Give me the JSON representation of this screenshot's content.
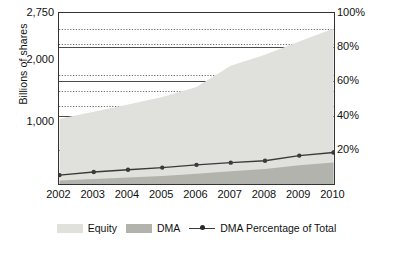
{
  "chart_data": {
    "type": "area",
    "title": "",
    "subtitle": "",
    "ylabel": "Billions of shares",
    "xlabel": "",
    "categories": [
      "2002",
      "2003",
      "2004",
      "2005",
      "2006",
      "2007",
      "2008",
      "2009",
      "2010"
    ],
    "x": [
      2002,
      2003,
      2004,
      2005,
      2006,
      2007,
      2008,
      2009,
      2010
    ],
    "yaxis_left": {
      "label": "Billions of shares",
      "ticks": [
        {
          "value": 1000,
          "text": "1,000"
        },
        {
          "value": 2000,
          "text": "2,000"
        },
        {
          "value": 2750,
          "text": "2,750"
        }
      ],
      "ylim": [
        0,
        2750
      ],
      "minor_gridlines": true,
      "minor_gridline_values": [
        1250,
        1500,
        1750,
        2250,
        2500
      ]
    },
    "yaxis_right": {
      "label": "",
      "ticks": [
        {
          "value": 20,
          "text": "20%"
        },
        {
          "value": 40,
          "text": "40%"
        },
        {
          "value": 60,
          "text": "60%"
        },
        {
          "value": 80,
          "text": "80%"
        },
        {
          "value": 100,
          "text": "100%"
        }
      ],
      "ylim": [
        0,
        100
      ]
    },
    "grid": true,
    "legend_position": "bottom",
    "series": [
      {
        "name": "Equity",
        "type": "area",
        "axis": "left",
        "color": "#e0e0dc",
        "values": [
          1050,
          1160,
          1280,
          1400,
          1560,
          1900,
          2080,
          2290,
          2500
        ]
      },
      {
        "name": "DMA",
        "type": "area",
        "axis": "left",
        "color": "#b3b3ae",
        "values": [
          55,
          80,
          105,
          130,
          165,
          205,
          240,
          300,
          345
        ]
      },
      {
        "name": "DMA Percentage of Total",
        "type": "line",
        "axis": "right",
        "color": "#3a3a3a",
        "marker": "circle",
        "values": [
          5.2,
          7.0,
          8.3,
          9.6,
          11.2,
          12.5,
          13.6,
          16.6,
          18.4
        ]
      }
    ]
  },
  "legend": {
    "items": [
      {
        "label": "Equity",
        "kind": "swatch",
        "color": "#e0e0dc"
      },
      {
        "label": "DMA",
        "kind": "swatch",
        "color": "#b3b3ae"
      },
      {
        "label": "DMA Percentage of Total",
        "kind": "line",
        "color": "#3a3a3a"
      }
    ]
  },
  "colors": {
    "equity_fill": "#e0e0dc",
    "dma_fill": "#b3b3ae",
    "line": "#3a3a3a",
    "axis": "#333333",
    "gridline_solid": "#4a4a4a",
    "gridline_dotted": "#6b6b6b",
    "text": "#111111",
    "background": "#ffffff"
  }
}
